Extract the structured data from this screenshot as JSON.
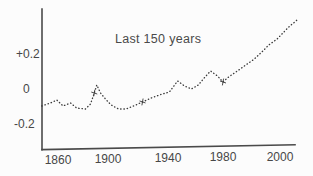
{
  "figure": {
    "title": "Last 150 years",
    "y_axis": {
      "tick_labels": [
        "+0.2",
        "0",
        "-0.2"
      ]
    },
    "x_axis": {
      "tick_labels": [
        "1860",
        "1900",
        "1940",
        "1980",
        "2000"
      ]
    },
    "colors": {
      "ink": "#3a3a3a",
      "axis": "#4a4a4a",
      "background": "#fcfcfc"
    }
  },
  "chart_data": {
    "type": "line",
    "line_style": "dotted",
    "title": "Last 150 years",
    "xlabel": "",
    "ylabel": "",
    "legend": "none",
    "grid": false,
    "x_ticks": [
      1860,
      1900,
      1940,
      1980,
      2000
    ],
    "y_ticks": [
      0.2,
      0,
      -0.2
    ],
    "y_tick_labels": [
      "+0.2",
      "0",
      "-0.2"
    ],
    "xlim": [
      1847,
      2008
    ],
    "ylim": [
      -0.32,
      0.45
    ],
    "points": [
      [
        1847,
        -0.097
      ],
      [
        1854,
        -0.08
      ],
      [
        1859,
        -0.063
      ],
      [
        1864,
        -0.097
      ],
      [
        1870,
        -0.08
      ],
      [
        1875,
        -0.109
      ],
      [
        1882,
        -0.114
      ],
      [
        1886,
        -0.086
      ],
      [
        1889,
        -0.023
      ],
      [
        1891,
        0.023
      ],
      [
        1894,
        -0.023
      ],
      [
        1898,
        -0.057
      ],
      [
        1902,
        -0.091
      ],
      [
        1907,
        -0.114
      ],
      [
        1912,
        -0.114
      ],
      [
        1917,
        -0.097
      ],
      [
        1923,
        -0.074
      ],
      [
        1929,
        -0.051
      ],
      [
        1936,
        -0.029
      ],
      [
        1941,
        -0.017
      ],
      [
        1947,
        0.046
      ],
      [
        1952,
        0.017
      ],
      [
        1957,
        0.0
      ],
      [
        1962,
        0.023
      ],
      [
        1967,
        0.069
      ],
      [
        1971,
        0.103
      ],
      [
        1976,
        0.074
      ],
      [
        1980,
        0.04
      ],
      [
        1982,
        0.069
      ],
      [
        1985,
        0.103
      ],
      [
        1988,
        0.137
      ],
      [
        1991,
        0.171
      ],
      [
        1994,
        0.217
      ],
      [
        1996,
        0.251
      ],
      [
        1999,
        0.286
      ],
      [
        2001,
        0.32
      ],
      [
        2003,
        0.354
      ],
      [
        2006,
        0.394
      ]
    ],
    "curve_mark_years": [
      1889,
      1923,
      1980
    ]
  }
}
